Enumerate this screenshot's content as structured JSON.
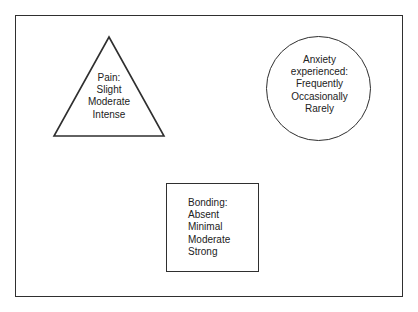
{
  "figure": {
    "background_color": "#ffffff",
    "stroke_color": "#2f2f2f",
    "text_color": "#222222",
    "shapes": {
      "triangle": {
        "shape_name": "triangle",
        "heading": "Pain:",
        "levels": [
          "Slight",
          "Moderate",
          "Intense"
        ],
        "text_align": "center"
      },
      "circle": {
        "shape_name": "circle",
        "heading_line_1": "Anxiety",
        "heading_line_2": "experienced:",
        "levels": [
          "Frequently",
          "Occasionally",
          "Rarely"
        ],
        "text_align": "center"
      },
      "square": {
        "shape_name": "square",
        "heading": "Bonding:",
        "levels": [
          "Absent",
          "Minimal",
          "Moderate",
          "Strong"
        ],
        "text_align": "left"
      }
    }
  }
}
